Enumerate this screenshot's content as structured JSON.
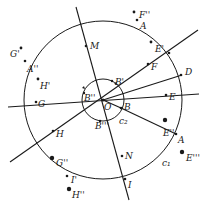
{
  "diagram": {
    "circles": [
      {
        "name": "c1",
        "label": "c₁"
      },
      {
        "name": "c2",
        "label": "c₂"
      }
    ],
    "points": {
      "O": "O",
      "A": "A",
      "B": "B",
      "D": "D",
      "E": "E",
      "F": "F",
      "G": "G",
      "H": "H",
      "I": "I",
      "M": "M",
      "N": "N",
      "B_prime": "B'",
      "B_dprime": "B''",
      "B_tprime": "B'''",
      "A_dprime": "A''",
      "E_prime": "E'",
      "E_dprime": "E''",
      "E_tprime": "E'''",
      "F_dprime": "F''",
      "G_prime": "G'",
      "G_dprime": "G''",
      "H_prime": "H'",
      "H_dprime": "H''",
      "I_prime": "I'"
    }
  }
}
